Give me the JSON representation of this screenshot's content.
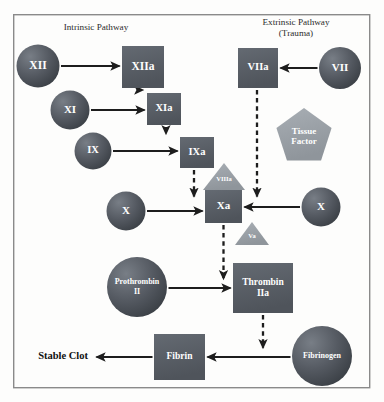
{
  "diagram": {
    "frame": {
      "x": 13,
      "y": 14,
      "width": 357,
      "height": 374,
      "border_color": "#8a8a8a"
    },
    "palette": {
      "circle_fill": "#4a4f56",
      "circle_fill_light": "#6e747c",
      "square_fill": "#585d64",
      "accessory_fill": "#9aa0a6",
      "arrow_color": "#1d1d1d",
      "text_on_shape": "#ffffff",
      "header_text": "#2b2b2b",
      "outcome_text": "#111111",
      "background": "#fdfdfc"
    },
    "headers": [
      {
        "id": "intrinsic",
        "lines": [
          "Intrinsic Pathway"
        ],
        "x": 96,
        "y": 30
      },
      {
        "id": "extrinsic",
        "lines": [
          "Extrinsic Pathway",
          "(Trauma)"
        ],
        "x": 296,
        "y": 25
      }
    ],
    "nodes": [
      {
        "id": "f12",
        "label": "XII",
        "lines": [
          "XII"
        ],
        "shape": "circle",
        "cx": 38,
        "cy": 66,
        "r": 21.5,
        "font_size": 11.5
      },
      {
        "id": "f12a",
        "label": "XIIa",
        "lines": [
          "XIIa"
        ],
        "shape": "square",
        "x": 122,
        "y": 46,
        "width": 42,
        "height": 42,
        "font_size": 11.5
      },
      {
        "id": "f11",
        "label": "XI",
        "lines": [
          "XI"
        ],
        "shape": "circle",
        "cx": 70,
        "cy": 110,
        "r": 19.5,
        "font_size": 11
      },
      {
        "id": "f11a",
        "label": "XIa",
        "lines": [
          "XIa"
        ],
        "shape": "square",
        "x": 147,
        "y": 93,
        "width": 34,
        "height": 32,
        "font_size": 10.5
      },
      {
        "id": "f9",
        "label": "IX",
        "lines": [
          "IX"
        ],
        "shape": "circle",
        "cx": 93,
        "cy": 151,
        "r": 18.5,
        "font_size": 10.5
      },
      {
        "id": "f9a",
        "label": "IXa",
        "lines": [
          "IXa"
        ],
        "shape": "square",
        "x": 180,
        "y": 137,
        "width": 34,
        "height": 31,
        "font_size": 10.5
      },
      {
        "id": "f8a",
        "label": "VIIIa",
        "lines": [
          "VIIIa"
        ],
        "shape": "triangle",
        "cx": 224,
        "top_y": 163,
        "half_width": 21,
        "height": 27,
        "font_size": 6.5,
        "accessory": true
      },
      {
        "id": "f10l",
        "label": "X",
        "lines": [
          "X"
        ],
        "shape": "circle",
        "cx": 126,
        "cy": 211,
        "r": 19.5,
        "font_size": 11
      },
      {
        "id": "f10a",
        "label": "Xa",
        "lines": [
          "Xa"
        ],
        "shape": "square",
        "x": 205,
        "y": 190,
        "width": 37,
        "height": 33,
        "font_size": 11
      },
      {
        "id": "f10r",
        "label": "X",
        "lines": [
          "X"
        ],
        "shape": "circle",
        "cx": 321,
        "cy": 207,
        "r": 19.5,
        "font_size": 11
      },
      {
        "id": "f5a",
        "label": "Va",
        "lines": [
          "Va"
        ],
        "shape": "triangle",
        "cx": 252,
        "top_y": 222,
        "half_width": 17,
        "height": 23,
        "font_size": 6.5,
        "accessory": true
      },
      {
        "id": "f7a",
        "label": "VIIa",
        "lines": [
          "VIIa"
        ],
        "shape": "square",
        "x": 238,
        "y": 48,
        "width": 40,
        "height": 40,
        "font_size": 10.5
      },
      {
        "id": "f7",
        "label": "VII",
        "lines": [
          "VII"
        ],
        "shape": "circle",
        "cx": 340,
        "cy": 68,
        "r": 21,
        "font_size": 11
      },
      {
        "id": "tf",
        "label": "Tissue Factor",
        "lines": [
          "Tissue",
          "Factor"
        ],
        "shape": "pentagon",
        "cx": 304,
        "cy": 137,
        "r": 29,
        "font_size": 9,
        "accessory": true
      },
      {
        "id": "prothrombin",
        "label": "Prothrombin II",
        "lines": [
          "Prothrombin",
          "II"
        ],
        "shape": "circle",
        "cx": 137,
        "cy": 287,
        "r": 30,
        "font_size": 8
      },
      {
        "id": "thrombin",
        "label": "Thrombin IIa",
        "lines": [
          "Thrombin",
          "IIa"
        ],
        "shape": "square",
        "x": 233,
        "y": 263,
        "width": 60,
        "height": 50,
        "font_size": 9.5
      },
      {
        "id": "fibrin",
        "label": "Fibrin",
        "lines": [
          "Fibrin"
        ],
        "shape": "square",
        "x": 154,
        "y": 334,
        "width": 51,
        "height": 46,
        "font_size": 9.5
      },
      {
        "id": "fibrinogen",
        "label": "Fibrinogen",
        "lines": [
          "Fibrinogen"
        ],
        "shape": "circle",
        "cx": 322,
        "cy": 356,
        "r": 30,
        "font_size": 8
      }
    ],
    "outcome": {
      "id": "stable-clot",
      "label": "Stable Clot",
      "x": 88,
      "y": 357
    },
    "edges": [
      {
        "id": "f12-to-f12a",
        "from": "f12",
        "to": "f12a",
        "style": "solid",
        "orientation": "horizontal-right"
      },
      {
        "id": "f12a-to-f11a",
        "from": "f12a",
        "to": "f11a",
        "style": "dashed",
        "orientation": "vertical-down"
      },
      {
        "id": "f11-to-f11a",
        "from": "f11",
        "to": "f11a",
        "style": "solid",
        "orientation": "horizontal-right"
      },
      {
        "id": "f11a-to-f9a",
        "from": "f11a",
        "to": "f9a",
        "style": "dashed",
        "orientation": "vertical-down"
      },
      {
        "id": "f9-to-f9a",
        "from": "f9",
        "to": "f9a",
        "style": "solid",
        "orientation": "horizontal-right"
      },
      {
        "id": "f9a-to-f10a",
        "from": "f9a",
        "to": "f10a",
        "style": "dashed",
        "orientation": "vertical-down"
      },
      {
        "id": "f10l-to-f10a",
        "from": "f10l",
        "to": "f10a",
        "style": "solid",
        "orientation": "horizontal-right"
      },
      {
        "id": "f7-to-f7a",
        "from": "f7",
        "to": "f7a",
        "style": "solid",
        "orientation": "horizontal-left"
      },
      {
        "id": "f7a-to-f10a",
        "from": "f7a",
        "to": "f10a",
        "style": "dashed",
        "orientation": "vertical-down"
      },
      {
        "id": "f10r-to-f10a",
        "from": "f10r",
        "to": "f10a",
        "style": "solid",
        "orientation": "horizontal-left"
      },
      {
        "id": "f10a-to-thrombin",
        "from": "f10a",
        "to": "thrombin",
        "style": "dashed",
        "orientation": "vertical-down"
      },
      {
        "id": "prothrombin-to-thrombin",
        "from": "prothrombin",
        "to": "thrombin",
        "style": "solid",
        "orientation": "horizontal-right"
      },
      {
        "id": "thrombin-to-fibrin",
        "from": "thrombin",
        "to": "fibrin",
        "style": "dashed",
        "orientation": "vertical-down"
      },
      {
        "id": "fibrinogen-to-fibrin",
        "from": "fibrinogen",
        "to": "fibrin",
        "style": "solid",
        "orientation": "horizontal-left"
      },
      {
        "id": "fibrin-to-stable-clot",
        "from": "fibrin",
        "to": "stable-clot",
        "style": "solid",
        "orientation": "horizontal-left"
      }
    ]
  }
}
